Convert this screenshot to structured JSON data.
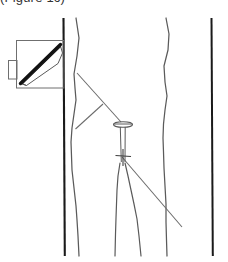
{
  "figure": {
    "caption_fragment": "(Figure 1c)",
    "background_color": "#ffffff",
    "ink_color": "#4a4a4a",
    "dark_ink_color": "#1a1a1a",
    "blade_color": "#111111",
    "inset_border_color": "#6f6f6f"
  },
  "inset": {
    "label": "probe-inset-box",
    "box": {
      "x": 16,
      "y": 40,
      "width": 48,
      "height": 48
    },
    "tab": {
      "x": 8,
      "y": 60,
      "width": 9,
      "height": 19
    },
    "wedge_points": "20,82 60,44 62,52 58,62 26,86",
    "blade_line": {
      "x1": 20,
      "y1": 84,
      "x2": 61,
      "y2": 44
    }
  },
  "body_outline": {
    "left_rail": {
      "x1": 63,
      "y1": 18,
      "x2": 65,
      "y2": 256
    },
    "right_rail": {
      "x1": 211,
      "y1": 18,
      "x2": 213,
      "y2": 256
    },
    "left_leg_curve": "76,18 79,46 74,74 76,100 73,126 71,150 72,176 76,206 78,232 79,256",
    "inner_left_curve": "119,162 117,186 116,210 116,234 115,256",
    "inner_right_curve": "125,162 130,186 135,210 139,234 141,256",
    "right_leg_curve": "166,18 169,44 164,70 167,96 164,122 163,148 164,176 166,206 166,232 167,256"
  },
  "needle": {
    "label": "needle-marker",
    "head_line": {
      "x1": 113,
      "y1": 124,
      "x2": 133,
      "y2": 124
    },
    "head_ellipse": {
      "cx": 123,
      "cy": 125,
      "rx": 10,
      "ry": 3
    },
    "shaft_left": {
      "x1": 120,
      "y1": 127,
      "x2": 121,
      "y2": 162
    },
    "shaft_right": {
      "x1": 125,
      "y1": 127,
      "x2": 125,
      "y2": 162
    },
    "hub_bar": {
      "x1": 115,
      "y1": 155,
      "x2": 131,
      "y2": 156
    },
    "tip_mark": {
      "x1": 123,
      "y1": 150,
      "x2": 123,
      "y2": 165
    }
  },
  "measurement_lines": {
    "upper_chord": {
      "x1": 77,
      "y1": 73,
      "x2": 122,
      "y2": 123
    },
    "mid_vertex": {
      "x": 103,
      "y": 104
    },
    "lower_chord": {
      "x1": 103,
      "y1": 104,
      "x2": 75,
      "y2": 129
    },
    "exit_ray": {
      "x1": 123,
      "y1": 158,
      "x2": 182,
      "y2": 227
    }
  }
}
